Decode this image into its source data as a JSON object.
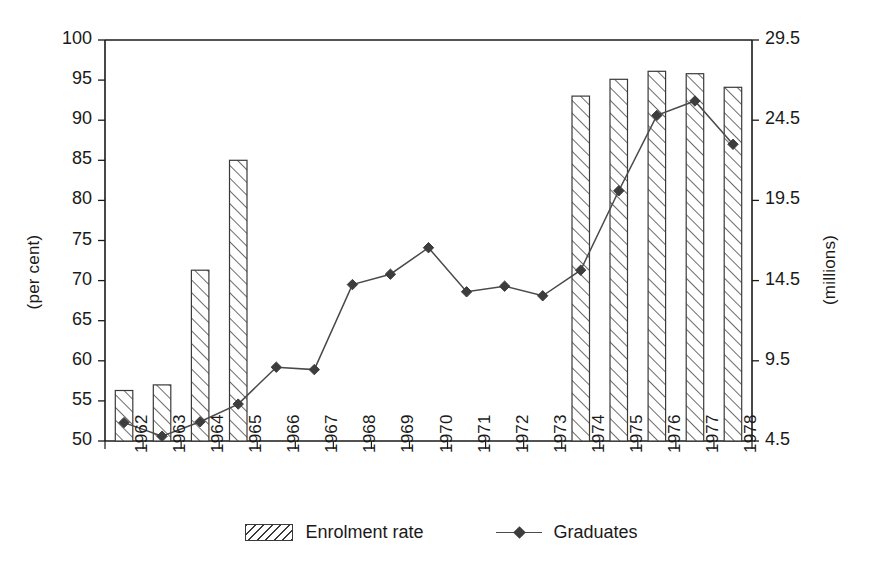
{
  "chart_data": {
    "type": "bar",
    "title": "",
    "subtitle": "",
    "xlabel": "",
    "ylabel": "(per cent)",
    "ylabel_right": "(millions)",
    "categories": [
      "1962",
      "1963",
      "1964",
      "1965",
      "1966",
      "1967",
      "1968",
      "1969",
      "1970",
      "1971",
      "1972",
      "1973",
      "1974",
      "1975",
      "1976",
      "1977",
      "1978"
    ],
    "ylim": [
      50,
      100
    ],
    "yticks": [
      50,
      55,
      60,
      65,
      70,
      75,
      80,
      85,
      90,
      95,
      100
    ],
    "ylim_right": [
      4.5,
      29.5
    ],
    "yticks_right": [
      "4.5",
      "9.5",
      "14.5",
      "19.5",
      "24.5",
      "29.5"
    ],
    "grid": false,
    "legend_position": "bottom-center",
    "series": [
      {
        "name": "Enrolment rate",
        "type": "bar",
        "axis": "left",
        "unit": "per cent",
        "style": "hatched",
        "values": [
          56.3,
          57.0,
          71.3,
          85.0,
          null,
          null,
          null,
          null,
          null,
          null,
          null,
          null,
          93.0,
          95.1,
          96.1,
          95.8,
          94.1
        ]
      },
      {
        "name": "Graduates",
        "type": "line",
        "axis": "right",
        "unit": "millions",
        "marker": "diamond",
        "values": [
          5.7,
          4.8,
          5.7,
          6.8,
          9.2,
          9.1,
          14.3,
          15.0,
          16.7,
          13.8,
          14.2,
          13.6,
          15.0,
          20.1,
          24.9,
          25.9,
          22.6
        ],
        "values_left_scale": [
          52.3,
          50.6,
          52.4,
          54.6,
          59.2,
          58.9,
          69.5,
          70.8,
          74.1,
          68.6,
          69.3,
          68.1,
          71.3,
          81.2,
          90.6,
          92.4,
          87.0
        ]
      }
    ],
    "colors": {
      "axis": "#1a1a1a",
      "bar_outline": "#3a3a3a",
      "bar_hatch": "#3a3a3a",
      "line": "#4a4a4a",
      "marker": "#3d3d3d",
      "background": "#ffffff"
    }
  },
  "legend": {
    "items": [
      {
        "label": "Enrolment rate",
        "swatch": "hatched-bar-swatch"
      },
      {
        "label": "Graduates",
        "swatch": "line-marker-swatch"
      }
    ]
  },
  "axes": {
    "left_title": "(per cent)",
    "right_title": "(millions)"
  }
}
